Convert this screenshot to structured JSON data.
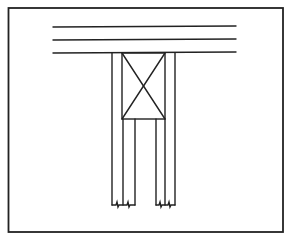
{
  "diagram": {
    "type": "framing-detail",
    "stroke_color": "#222222",
    "background_color": "#ffffff",
    "frame": {
      "x": 8,
      "y": 8,
      "width": 275,
      "height": 224
    },
    "horizontal_members": [
      {
        "y": 27,
        "x1": 53,
        "x2": 236
      },
      {
        "y": 40,
        "x1": 53,
        "x2": 236
      },
      {
        "y": 53,
        "x1": 53,
        "x2": 236
      }
    ],
    "cross_block": {
      "x": 122,
      "y": 53,
      "width": 43,
      "height": 66
    },
    "vertical_lines": [
      112,
      123,
      135,
      156,
      165,
      175
    ],
    "post_bottom_y": 205,
    "labels": []
  }
}
